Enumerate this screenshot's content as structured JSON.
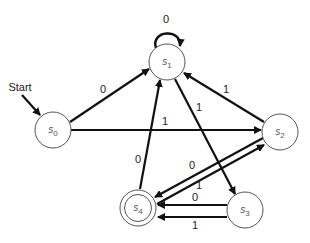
{
  "diagram": {
    "type": "finite-state-automaton",
    "start_label": "Start",
    "states": [
      {
        "id": "s0",
        "name": "s",
        "sub": "0",
        "x": 53,
        "y": 130,
        "accepting": false,
        "start": true
      },
      {
        "id": "s1",
        "name": "s",
        "sub": "1",
        "x": 167,
        "y": 62,
        "accepting": false,
        "start": false
      },
      {
        "id": "s2",
        "name": "s",
        "sub": "2",
        "x": 280,
        "y": 132,
        "accepting": false,
        "start": false
      },
      {
        "id": "s3",
        "name": "s",
        "sub": "3",
        "x": 245,
        "y": 210,
        "accepting": false,
        "start": false
      },
      {
        "id": "s4",
        "name": "s",
        "sub": "4",
        "x": 138,
        "y": 208,
        "accepting": true,
        "start": false
      }
    ],
    "transitions": [
      {
        "from": "s0",
        "to": "s1",
        "label": "0"
      },
      {
        "from": "s1",
        "to": "s1",
        "label": "0"
      },
      {
        "from": "s0",
        "to": "s2",
        "label": "1"
      },
      {
        "from": "s1",
        "to": "s3",
        "label": "1"
      },
      {
        "from": "s2",
        "to": "s1",
        "label": "1"
      },
      {
        "from": "s2",
        "to": "s4",
        "label": "0"
      },
      {
        "from": "s4",
        "to": "s2",
        "label": "1"
      },
      {
        "from": "s4",
        "to": "s1",
        "label": "0"
      },
      {
        "from": "s3",
        "to": "s4",
        "label": "0"
      },
      {
        "from": "s3",
        "to": "s4",
        "label": "1"
      }
    ],
    "colors": {
      "edge": "#111111",
      "node_stroke": "#555555",
      "node_fill": "#ffffff",
      "label": "#222222"
    }
  }
}
